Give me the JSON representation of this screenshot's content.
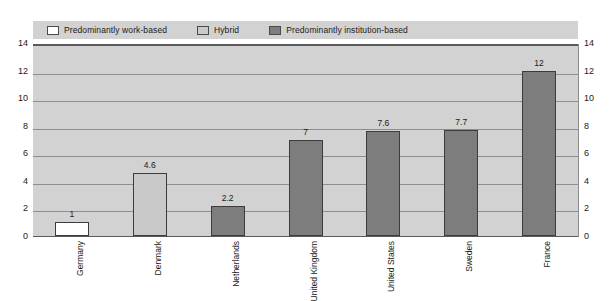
{
  "chart_data": {
    "type": "bar",
    "title": "",
    "subtitle": "",
    "xlabel": "",
    "ylabel": "",
    "ylim": [
      0,
      14
    ],
    "yticks": [
      0,
      2,
      4,
      6,
      8,
      10,
      12,
      14
    ],
    "grid": true,
    "dual_y_axis": true,
    "legend_position": "top",
    "categories": [
      "Germany",
      "Denmark",
      "Netherlands",
      "United Kingdom",
      "United States",
      "Sweden",
      "France"
    ],
    "values": [
      1,
      4.6,
      2.2,
      7,
      7.6,
      7.7,
      12
    ],
    "value_labels": [
      "1",
      "4.6",
      "2.2",
      "7",
      "7.6",
      "7.7",
      "12"
    ],
    "point_categories": [
      "work-based",
      "hybrid",
      "institution-based",
      "institution-based",
      "institution-based",
      "institution-based",
      "institution-based"
    ],
    "series": [
      {
        "name": "Predominantly work-based",
        "color": "#ffffff",
        "values": [
          1,
          null,
          null,
          null,
          null,
          null,
          null
        ]
      },
      {
        "name": "Hybrid",
        "color": "#c9c9c9",
        "values": [
          null,
          4.6,
          null,
          null,
          null,
          null,
          null
        ]
      },
      {
        "name": "Predominantly institution-based",
        "color": "#7d7d7d",
        "values": [
          null,
          null,
          2.2,
          7,
          7.6,
          7.7,
          12
        ]
      }
    ]
  },
  "legend": {
    "items": [
      {
        "label": "Predominantly work-based",
        "color": "#ffffff",
        "swatch_class": "sw-work"
      },
      {
        "label": "Hybrid",
        "color": "#c9c9c9",
        "swatch_class": "sw-hybrid"
      },
      {
        "label": "Predominantly institution-based",
        "color": "#7d7d7d",
        "swatch_class": "sw-inst"
      }
    ]
  },
  "axis": {
    "left_ticks": [
      "14",
      "12",
      "10",
      "8",
      "6",
      "4",
      "2",
      "0"
    ],
    "right_ticks": [
      "14",
      "12",
      "10",
      "8",
      "6",
      "4",
      "2",
      "0"
    ]
  },
  "colors": {
    "plot_background": "#d2d2d2",
    "legend_background": "#d2d2d2",
    "gridline": "#8e8e8e",
    "axis_line": "#5a5a5a",
    "bar_border": "#3c3c3c",
    "text": "#1a1a1a"
  }
}
